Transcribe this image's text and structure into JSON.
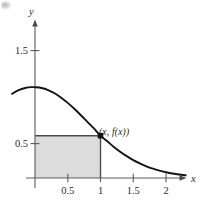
{
  "figure": {
    "background_color": "#ffffff",
    "ink_color": "#1a1a1a",
    "shade_color": "#dcdcdc",
    "shade_edge_color": "#555555"
  },
  "axes": {
    "x_axis_label": "x",
    "y_axis_label": "y",
    "x_ticks": [
      {
        "value": 0.5,
        "label": "0.5"
      },
      {
        "value": 1,
        "label": "1"
      },
      {
        "value": 1.5,
        "label": "1.5"
      },
      {
        "value": 2,
        "label": "2"
      }
    ],
    "y_ticks": [
      {
        "value": 0.5,
        "label": "0.5"
      },
      {
        "value": 1.5,
        "label": "1.5"
      }
    ]
  },
  "annotations": {
    "point_label": "(x, f(x))"
  },
  "chart_data": {
    "type": "line",
    "title": "",
    "xlabel": "x",
    "ylabel": "y",
    "xlim": [
      -0.35,
      2.3
    ],
    "ylim": [
      0,
      1.85
    ],
    "grid": false,
    "legend": null,
    "xticks": [
      0.5,
      1,
      1.5,
      2
    ],
    "xticklabels": [
      "0.5",
      "1",
      "1.5",
      "2"
    ],
    "yticks": [
      0.5,
      1.5
    ],
    "yticklabels": [
      "0.5",
      "1.5"
    ],
    "series": [
      {
        "name": "f(x)",
        "type": "line",
        "comment": "bell-shaped decreasing curve, peak near x=0",
        "x": [
          -0.35,
          -0.25,
          -0.15,
          -0.05,
          0.0,
          0.1,
          0.2,
          0.3,
          0.4,
          0.5,
          0.6,
          0.7,
          0.8,
          0.9,
          1.0,
          1.1,
          1.2,
          1.3,
          1.4,
          1.5,
          1.6,
          1.7,
          1.8,
          1.9,
          2.0,
          2.1,
          2.2,
          2.3
        ],
        "y": [
          0.905,
          0.945,
          0.968,
          0.977,
          0.976,
          0.968,
          0.946,
          0.911,
          0.864,
          0.808,
          0.744,
          0.675,
          0.604,
          0.533,
          0.455,
          0.397,
          0.337,
          0.283,
          0.235,
          0.193,
          0.157,
          0.126,
          0.1,
          0.079,
          0.062,
          0.048,
          0.037,
          0.029
        ]
      }
    ],
    "shaded_rectangle": {
      "label": "inscribed rectangle",
      "x0": 0,
      "x1": 1,
      "y0": 0,
      "y1": 0.455,
      "fill": "#dcdcdc",
      "edge": "#555555"
    },
    "points": [
      {
        "label": "(x, f(x))",
        "x": 1.0,
        "y": 0.455,
        "marker": "square",
        "filled": true
      }
    ]
  }
}
